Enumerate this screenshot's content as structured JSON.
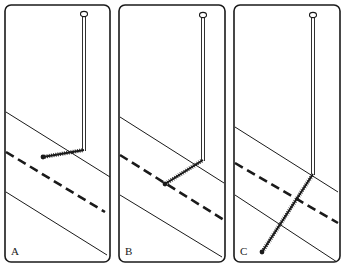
{
  "figure": {
    "colors": {
      "ink": "#1a1a1a",
      "background": "#ffffff"
    },
    "panels": [
      {
        "label": "A",
        "frame": {
          "x": 5,
          "y": 5,
          "w": 105,
          "h": 257
        },
        "bands": {
          "top_line": [
            [
              6,
              112
            ],
            [
              110,
              177
            ]
          ],
          "dashed_line": [
            [
              6,
              152
            ],
            [
              105,
              212
            ]
          ],
          "bottom_line": [
            [
              6,
              192
            ],
            [
              107,
              255
            ]
          ]
        },
        "pin": {
          "head": [
            84,
            14
          ],
          "elbow": [
            84,
            150
          ],
          "tip": [
            43,
            157
          ],
          "tip_position": "left of elbow, just above the dashed line"
        }
      },
      {
        "label": "B",
        "frame": {
          "x": 119,
          "y": 5,
          "w": 106,
          "h": 257
        },
        "bands": {
          "top_line": [
            [
              120,
              117
            ],
            [
              224,
              183
            ]
          ],
          "dashed_line": [
            [
              120,
              155
            ],
            [
              224,
              220
            ]
          ],
          "bottom_line": [
            [
              120,
              195
            ],
            [
              222,
              257
            ]
          ]
        },
        "pin": {
          "head": [
            203,
            15
          ],
          "elbow": [
            203,
            160
          ],
          "tip": [
            165,
            184
          ],
          "tip_position": "on the dashed line"
        }
      },
      {
        "label": "C",
        "frame": {
          "x": 234,
          "y": 5,
          "w": 106,
          "h": 257
        },
        "bands": {
          "top_line": [
            [
              235,
              127
            ],
            [
              338,
              192
            ]
          ],
          "dashed_line": [
            [
              235,
              163
            ],
            [
              338,
              223
            ]
          ],
          "bottom_line": [
            [
              235,
              195
            ],
            [
              337,
              262
            ]
          ]
        },
        "pin": {
          "head": [
            313,
            15
          ],
          "elbow": [
            313,
            174
          ],
          "tip": [
            262,
            252
          ],
          "tip_position": "below the bottom line"
        }
      }
    ]
  }
}
